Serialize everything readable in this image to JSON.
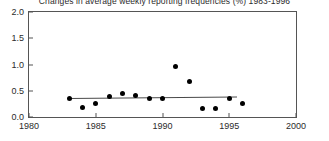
{
  "chart_data": {
    "type": "scatter",
    "title": "Changes in average weekly reporting frequencies (%) 1983-1996",
    "xlabel": "",
    "ylabel": "",
    "xlim": [
      1980,
      2000
    ],
    "ylim": [
      0.0,
      2.0
    ],
    "grid": false,
    "legend": null,
    "xticks": [
      "1980",
      "1985",
      "1990",
      "1995",
      "2000"
    ],
    "xtick_values": [
      1980,
      1985,
      1990,
      1995,
      2000
    ],
    "yticks": [
      "0.0",
      "0.5",
      "1.0",
      "1.5",
      "2.0"
    ],
    "ytick_values": [
      0.0,
      0.5,
      1.0,
      1.5,
      2.0
    ],
    "x": [
      1983,
      1984,
      1985,
      1986,
      1987,
      1988,
      1989,
      1990,
      1991,
      1992,
      1993,
      1994,
      1995,
      1996
    ],
    "values": [
      0.35,
      0.18,
      0.25,
      0.4,
      0.45,
      0.41,
      0.35,
      0.35,
      0.97,
      0.68,
      0.17,
      0.16,
      0.35,
      0.25
    ],
    "series": [
      {
        "name": "Annual change",
        "x": [
          1983,
          1984,
          1985,
          1986,
          1987,
          1988,
          1989,
          1990,
          1991,
          1992,
          1993,
          1994,
          1995,
          1996
        ],
        "values": [
          0.35,
          0.18,
          0.25,
          0.4,
          0.45,
          0.41,
          0.35,
          0.35,
          0.97,
          0.68,
          0.17,
          0.16,
          0.35,
          0.25
        ],
        "marker": "filled-circle",
        "color": "#000000"
      },
      {
        "name": "Trend line",
        "type": "line",
        "x": [
          1983,
          1995.6
        ],
        "values": [
          0.37,
          0.4
        ],
        "color": "#4a4a4a"
      }
    ]
  },
  "colors": {
    "axis": "#555555",
    "marker": "#000000",
    "trend": "#4a4a4a",
    "text": "#2b2b2b",
    "background": "#ffffff"
  }
}
